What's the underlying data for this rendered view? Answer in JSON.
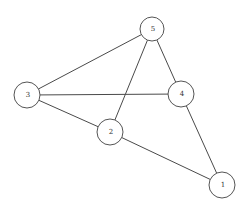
{
  "graph": {
    "type": "undirected",
    "nodes": [
      {
        "id": "5",
        "label": "5",
        "x": 152,
        "y": 29,
        "r": 12
      },
      {
        "id": "3",
        "label": "3",
        "x": 27,
        "y": 95,
        "r": 13
      },
      {
        "id": "4",
        "label": "4",
        "x": 181,
        "y": 94,
        "r": 13
      },
      {
        "id": "2",
        "label": "2",
        "x": 110,
        "y": 132,
        "r": 13
      },
      {
        "id": "1",
        "label": "1",
        "x": 222,
        "y": 185,
        "r": 13
      }
    ],
    "edges": [
      {
        "from": "5",
        "to": "3"
      },
      {
        "from": "5",
        "to": "2"
      },
      {
        "from": "5",
        "to": "4"
      },
      {
        "from": "3",
        "to": "4"
      },
      {
        "from": "3",
        "to": "2"
      },
      {
        "from": "2",
        "to": "1"
      },
      {
        "from": "4",
        "to": "1"
      }
    ]
  },
  "colors": {
    "background": "#ffffff",
    "edge": "#4a4a4a",
    "node_stroke": "#555555",
    "label": "#333333"
  }
}
